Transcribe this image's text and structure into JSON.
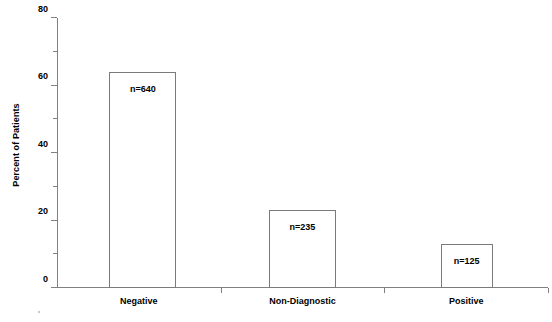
{
  "chart_data": {
    "type": "bar",
    "title": "",
    "xlabel": "",
    "ylabel": "Percent of Patients",
    "categories": [
      "Negative",
      "Non-Diagnostic",
      "Positive"
    ],
    "values": [
      64,
      23,
      13
    ],
    "annotations": [
      "n=640",
      "n=235",
      "n=125"
    ],
    "counts": [
      640,
      235,
      125
    ],
    "ylim": [
      0,
      80
    ],
    "y_major_ticks": [
      0,
      20,
      40,
      60,
      80
    ],
    "y_minor_ticks": [
      10,
      30,
      50,
      70
    ],
    "y_tick_labels": [
      "0",
      "20",
      "40",
      "60",
      "80"
    ],
    "grid": false,
    "legend": false,
    "bar_fill_color": "#ffffff",
    "bar_border_color": "#7a7a7a",
    "axis_color": "#808080",
    "text_color": "#000000",
    "background_color": "#ffffff"
  }
}
